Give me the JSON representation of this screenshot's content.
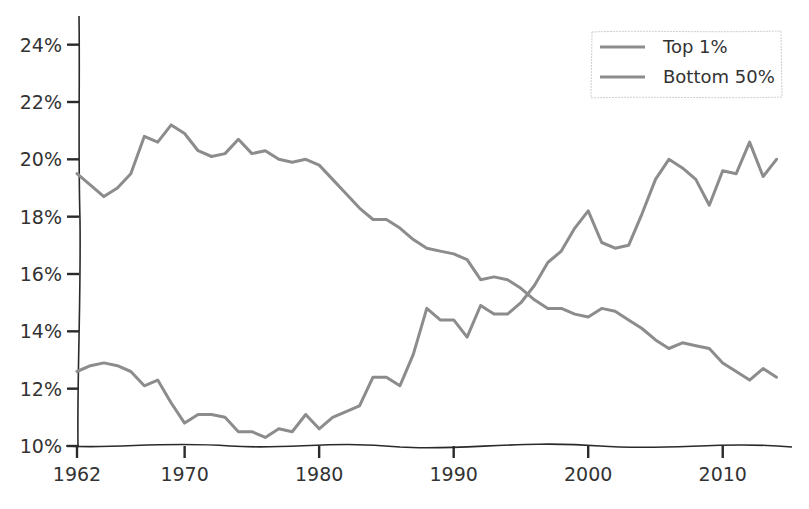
{
  "chart_data": {
    "type": "line",
    "title": "",
    "xlabel": "",
    "ylabel": "",
    "xlim": [
      1962,
      2015
    ],
    "ylim": [
      10,
      25
    ],
    "grid": false,
    "legend_position": "top-right",
    "x_ticks": [
      1962,
      1970,
      1980,
      1990,
      2000,
      2010
    ],
    "x_tick_labels": [
      "1962",
      "1970",
      "1980",
      "1990",
      "2000",
      "2010"
    ],
    "y_ticks": [
      10,
      12,
      14,
      16,
      18,
      20,
      22,
      24
    ],
    "y_tick_labels": [
      "10%",
      "12%",
      "14%",
      "16%",
      "18%",
      "20%",
      "22%",
      "24%"
    ],
    "line_color": "#8c8c8c",
    "x": [
      1962,
      1963,
      1964,
      1965,
      1966,
      1967,
      1968,
      1969,
      1970,
      1971,
      1972,
      1973,
      1974,
      1975,
      1976,
      1977,
      1978,
      1979,
      1980,
      1981,
      1982,
      1983,
      1984,
      1985,
      1986,
      1987,
      1988,
      1989,
      1990,
      1991,
      1992,
      1993,
      1994,
      1995,
      1996,
      1997,
      1998,
      1999,
      2000,
      2001,
      2002,
      2003,
      2004,
      2005,
      2006,
      2007,
      2008,
      2009,
      2010,
      2011,
      2012,
      2013,
      2014
    ],
    "series": [
      {
        "name": "Top 1%",
        "values": [
          19.5,
          19.1,
          18.7,
          19.0,
          19.5,
          20.8,
          20.6,
          21.2,
          20.9,
          20.3,
          20.1,
          20.2,
          20.7,
          20.2,
          20.3,
          20.0,
          19.9,
          20.0,
          19.8,
          19.3,
          18.8,
          18.3,
          17.9,
          17.9,
          17.6,
          17.2,
          16.9,
          16.8,
          16.7,
          16.5,
          15.8,
          15.9,
          15.8,
          15.5,
          15.1,
          14.8,
          14.8,
          14.6,
          14.5,
          14.8,
          14.7,
          14.4,
          14.1,
          13.7,
          13.4,
          13.6,
          13.5,
          13.4,
          12.9,
          12.6,
          12.3,
          12.7,
          12.4
        ]
      },
      {
        "name": "Bottom 50%",
        "values": [
          12.6,
          12.8,
          12.9,
          12.8,
          12.6,
          12.1,
          12.3,
          11.5,
          10.8,
          11.1,
          11.1,
          11.0,
          10.5,
          10.5,
          10.3,
          10.6,
          10.5,
          11.1,
          10.6,
          11.0,
          11.2,
          11.4,
          12.4,
          12.4,
          12.1,
          13.2,
          14.8,
          14.4,
          14.4,
          13.8,
          14.9,
          14.6,
          14.6,
          15.0,
          15.6,
          16.4,
          16.8,
          17.6,
          18.2,
          17.1,
          16.9,
          17.0,
          18.1,
          19.3,
          20.0,
          19.7,
          19.3,
          18.4,
          19.6,
          19.5,
          20.6,
          19.4,
          20.0
        ]
      }
    ]
  },
  "legend": {
    "items": [
      "Top 1%",
      "Bottom 50%"
    ]
  }
}
